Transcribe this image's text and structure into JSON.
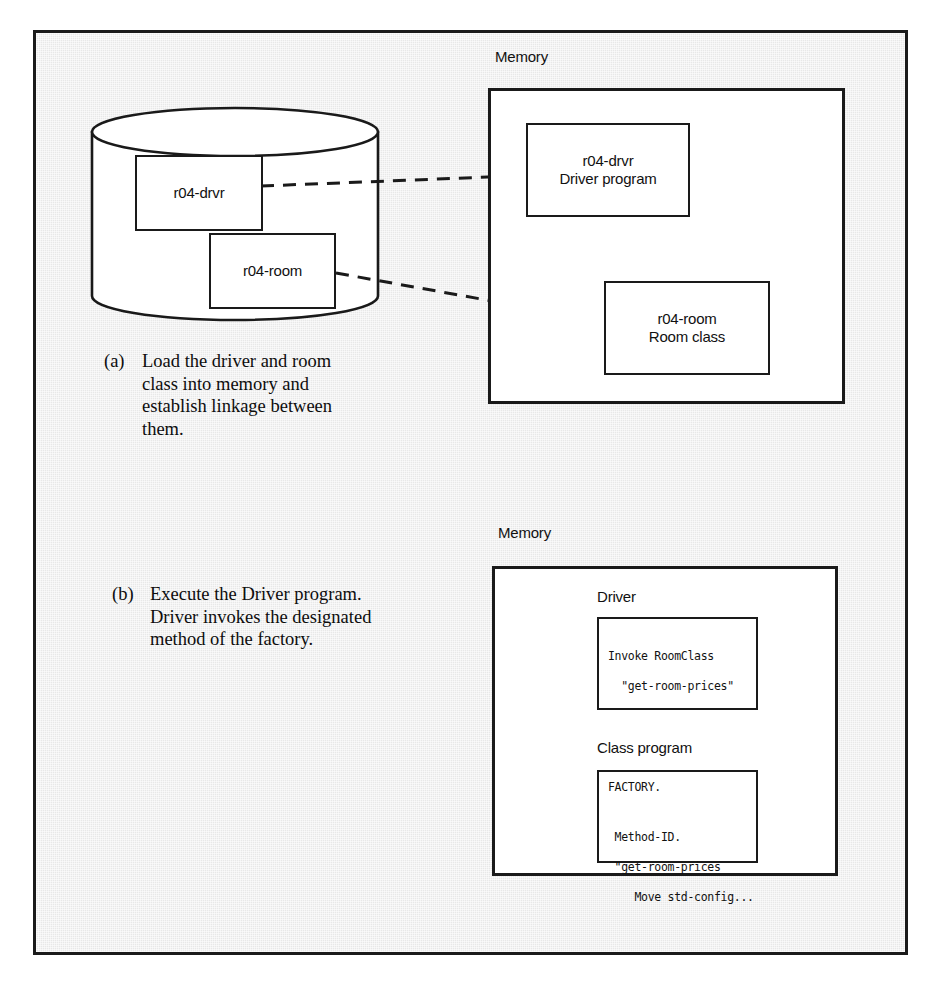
{
  "figure": {
    "background_color": "#e8e8e8",
    "line_color": "#1a1a1a"
  },
  "panel_a": {
    "caption_tag": "(a)",
    "caption_lines": [
      "Load the driver and room",
      "class into memory and",
      "establish linkage between",
      "them."
    ],
    "disk": {
      "name": "disk-cylinder",
      "files": [
        {
          "label": "r04-drvr"
        },
        {
          "label": "r04-room"
        }
      ]
    },
    "memory": {
      "title": "Memory",
      "items": [
        {
          "line1": "r04-drvr",
          "line2": "Driver program"
        },
        {
          "line1": "r04-room",
          "line2": "Room class"
        }
      ]
    }
  },
  "panel_b": {
    "caption_tag": "(b)",
    "caption_lines": [
      "Execute the Driver program.",
      "Driver invokes the designated",
      "method of the factory."
    ],
    "memory": {
      "title": "Memory",
      "driver": {
        "title": "Driver",
        "code_lines": [
          "Invoke RoomClass",
          "  \"get-room-prices\""
        ]
      },
      "class_program": {
        "title": "Class program",
        "code_lines": [
          "FACTORY.",
          "",
          " Method-ID.",
          " \"get-room-prices",
          "    Move std-config..."
        ]
      }
    }
  }
}
